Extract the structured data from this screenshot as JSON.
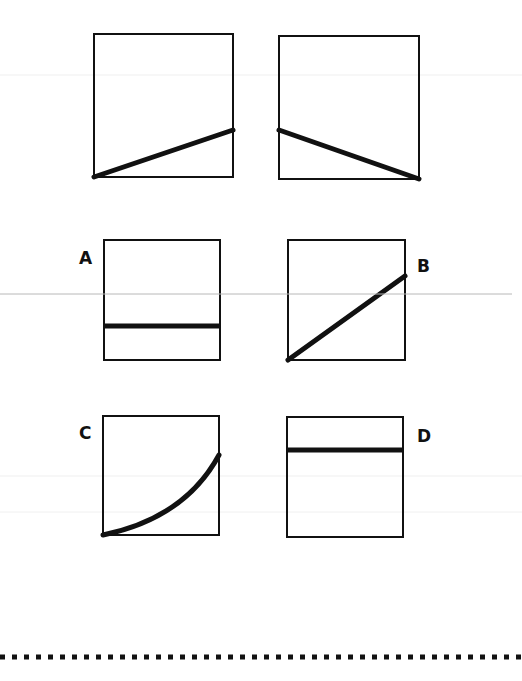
{
  "diagram": {
    "type": "graph-shape comparison (multiple choice)",
    "stroke_color": "#111111",
    "reference_graphs": [
      {
        "id": "ref-1",
        "shape": "straight line rising from bottom-left to right side at about one-third height",
        "box": [
          94,
          34,
          233,
          177
        ],
        "path": "M94,177 L233,130"
      },
      {
        "id": "ref-2",
        "shape": "straight line falling from left side at about one-third height to bottom-right",
        "box": [
          279,
          36,
          419,
          179
        ],
        "path": "M279,130 L419,179"
      }
    ],
    "options": [
      {
        "label": "A",
        "shape": "horizontal line at low height",
        "box": [
          104,
          240,
          220,
          360
        ],
        "path": "M104,326 L220,326",
        "label_pos": [
          79,
          250
        ]
      },
      {
        "label": "B",
        "shape": "straight line rising from bottom-left to upper right",
        "box": [
          288,
          240,
          405,
          360
        ],
        "path": "M288,360 L405,276",
        "label_pos": [
          417,
          258
        ]
      },
      {
        "label": "C",
        "shape": "upward-curving (concave up) line from bottom-left to upper right",
        "box": [
          103,
          416,
          219,
          535
        ],
        "path": "M103,535 Q180,520 219,455",
        "label_pos": [
          79,
          425
        ]
      },
      {
        "label": "D",
        "shape": "horizontal line near the top",
        "box": [
          287,
          417,
          403,
          537
        ],
        "path": "M287,450 L403,450",
        "label_pos": [
          417,
          428
        ]
      }
    ],
    "separator": {
      "style": "dotted squares",
      "y": 657
    },
    "scan_line": {
      "y": 294,
      "color": "#b8b8b8"
    }
  }
}
